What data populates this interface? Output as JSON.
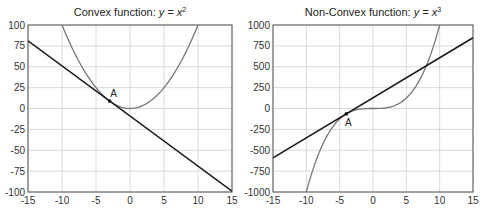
{
  "chart_data": [
    {
      "type": "line",
      "title": "Convex function: y = x²",
      "title_prefix": "Convex function: ",
      "title_math": "y = x",
      "title_sup": "2",
      "xlabel": "",
      "ylabel": "",
      "xlim": [
        -15,
        15
      ],
      "ylim": [
        -100,
        100
      ],
      "grid": true,
      "x_ticks": [
        -15,
        -10,
        -5,
        0,
        5,
        10,
        15
      ],
      "y_ticks": [
        -100,
        -75,
        -50,
        -25,
        0,
        25,
        50,
        75,
        100
      ],
      "series": [
        {
          "name": "y = x^2",
          "kind": "curve",
          "color": "#777777",
          "x": [
            -10,
            -9,
            -8,
            -7,
            -6,
            -5,
            -4,
            -3,
            -2,
            -1,
            0,
            1,
            2,
            3,
            4,
            5,
            6,
            7,
            8,
            9,
            10
          ],
          "y": [
            100,
            81,
            64,
            49,
            36,
            25,
            16,
            9,
            4,
            1,
            0,
            1,
            4,
            9,
            16,
            25,
            36,
            49,
            64,
            81,
            100
          ]
        },
        {
          "name": "tangent at A: y = -6x - 9",
          "kind": "line",
          "color": "#1a1a1a",
          "x": [
            -15,
            15
          ],
          "y": [
            81,
            -99
          ]
        }
      ],
      "annotations": [
        {
          "label": "A",
          "x": -3,
          "y": 9
        }
      ]
    },
    {
      "type": "line",
      "title": "Non-Convex function: y = x³",
      "title_prefix": "Non-Convex function: ",
      "title_math": "y = x",
      "title_sup": "3",
      "xlabel": "",
      "ylabel": "",
      "xlim": [
        -15,
        15
      ],
      "ylim": [
        -1000,
        1000
      ],
      "grid": true,
      "x_ticks": [
        -15,
        -10,
        -5,
        0,
        5,
        10,
        15
      ],
      "y_ticks": [
        -1000,
        -750,
        -500,
        -250,
        0,
        250,
        500,
        750,
        1000
      ],
      "series": [
        {
          "name": "y = x^3",
          "kind": "curve",
          "color": "#777777",
          "x": [
            -10,
            -9,
            -8,
            -7,
            -6,
            -5,
            -4,
            -3,
            -2,
            -1,
            0,
            1,
            2,
            3,
            4,
            5,
            6,
            7,
            8,
            9,
            10
          ],
          "y": [
            -1000,
            -729,
            -512,
            -343,
            -216,
            -125,
            -64,
            -27,
            -8,
            -1,
            0,
            1,
            8,
            27,
            64,
            125,
            216,
            343,
            512,
            729,
            1000
          ]
        },
        {
          "name": "tangent at A: y = 48x + 128",
          "kind": "line",
          "color": "#1a1a1a",
          "x": [
            -15,
            15
          ],
          "y": [
            -592,
            848
          ]
        }
      ],
      "annotations": [
        {
          "label": "A",
          "x": -4,
          "y": -64
        }
      ]
    }
  ],
  "layout": {
    "panels": [
      {
        "left": 28,
        "top": 25,
        "right": 232,
        "bottom": 192
      },
      {
        "left": 273,
        "top": 25,
        "right": 473,
        "bottom": 192
      }
    ]
  }
}
